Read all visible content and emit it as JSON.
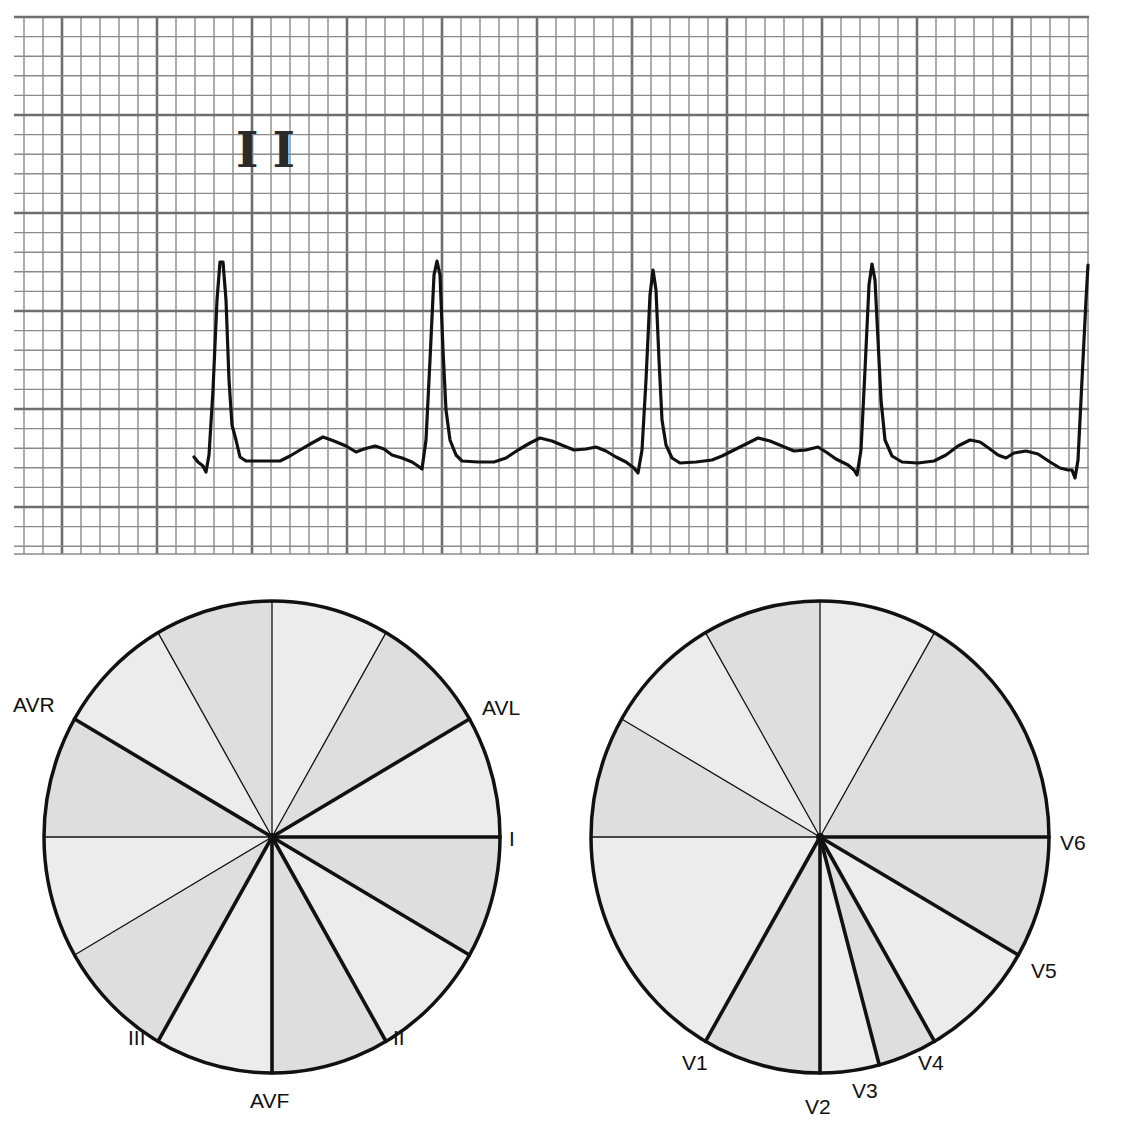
{
  "ecg_strip": {
    "lead_label": "II",
    "grid": {
      "left": 14,
      "top": 16,
      "right": 1089,
      "bottom": 554,
      "major_x_origin": 62,
      "major_x_step": 95,
      "major_y_origin": 17,
      "major_y_step": 98,
      "minor_per_major": 5
    },
    "colors": {
      "grid_minor": "#8a8a8a",
      "grid_major": "#6e6e6e",
      "trace": "#111111",
      "paper": "#ffffff"
    },
    "trace_points": [
      [
        194,
        457
      ],
      [
        198,
        462
      ],
      [
        203,
        466
      ],
      [
        206,
        472
      ],
      [
        209,
        455
      ],
      [
        213,
        390
      ],
      [
        217,
        300
      ],
      [
        220,
        262
      ],
      [
        223,
        262
      ],
      [
        226,
        300
      ],
      [
        229,
        380
      ],
      [
        232,
        425
      ],
      [
        236,
        440
      ],
      [
        240,
        457
      ],
      [
        246,
        461
      ],
      [
        262,
        461
      ],
      [
        280,
        461
      ],
      [
        290,
        456
      ],
      [
        300,
        450
      ],
      [
        312,
        443
      ],
      [
        323,
        437
      ],
      [
        334,
        441
      ],
      [
        346,
        446
      ],
      [
        356,
        452
      ],
      [
        364,
        449
      ],
      [
        375,
        446
      ],
      [
        384,
        449
      ],
      [
        392,
        455
      ],
      [
        402,
        458
      ],
      [
        412,
        462
      ],
      [
        418,
        466
      ],
      [
        422,
        469
      ],
      [
        426,
        440
      ],
      [
        430,
        360
      ],
      [
        434,
        275
      ],
      [
        437,
        261
      ],
      [
        440,
        275
      ],
      [
        443,
        350
      ],
      [
        446,
        410
      ],
      [
        450,
        440
      ],
      [
        456,
        455
      ],
      [
        462,
        461
      ],
      [
        478,
        462
      ],
      [
        494,
        462
      ],
      [
        506,
        458
      ],
      [
        518,
        450
      ],
      [
        530,
        443
      ],
      [
        540,
        438
      ],
      [
        552,
        441
      ],
      [
        564,
        446
      ],
      [
        574,
        450
      ],
      [
        586,
        449
      ],
      [
        596,
        447
      ],
      [
        606,
        451
      ],
      [
        616,
        457
      ],
      [
        626,
        462
      ],
      [
        634,
        468
      ],
      [
        638,
        473
      ],
      [
        642,
        450
      ],
      [
        646,
        380
      ],
      [
        650,
        295
      ],
      [
        653,
        270
      ],
      [
        656,
        290
      ],
      [
        659,
        360
      ],
      [
        662,
        420
      ],
      [
        666,
        445
      ],
      [
        672,
        458
      ],
      [
        680,
        463
      ],
      [
        696,
        462
      ],
      [
        712,
        460
      ],
      [
        722,
        456
      ],
      [
        734,
        450
      ],
      [
        746,
        444
      ],
      [
        758,
        438
      ],
      [
        770,
        441
      ],
      [
        782,
        446
      ],
      [
        794,
        451
      ],
      [
        806,
        450
      ],
      [
        818,
        447
      ],
      [
        826,
        452
      ],
      [
        836,
        459
      ],
      [
        848,
        465
      ],
      [
        854,
        470
      ],
      [
        857,
        475
      ],
      [
        861,
        450
      ],
      [
        865,
        370
      ],
      [
        869,
        285
      ],
      [
        872,
        264
      ],
      [
        875,
        280
      ],
      [
        878,
        340
      ],
      [
        881,
        400
      ],
      [
        885,
        440
      ],
      [
        892,
        456
      ],
      [
        902,
        462
      ],
      [
        918,
        463
      ],
      [
        934,
        461
      ],
      [
        946,
        455
      ],
      [
        958,
        446
      ],
      [
        970,
        440
      ],
      [
        980,
        442
      ],
      [
        990,
        449
      ],
      [
        998,
        455
      ],
      [
        1006,
        458
      ],
      [
        1014,
        453
      ],
      [
        1026,
        451
      ],
      [
        1038,
        454
      ],
      [
        1050,
        462
      ],
      [
        1060,
        468
      ],
      [
        1068,
        470
      ],
      [
        1072,
        470
      ],
      [
        1075,
        478
      ],
      [
        1078,
        460
      ],
      [
        1082,
        380
      ],
      [
        1086,
        300
      ],
      [
        1088,
        265
      ]
    ]
  },
  "limb_leads_diagram": {
    "center": [
      272,
      837
    ],
    "rx": 228,
    "ry": 236,
    "fills": {
      "dark": "#dedede",
      "light": "#ececec"
    },
    "spokes": [
      {
        "angle": 0,
        "weight": "thick"
      },
      {
        "angle": 30,
        "weight": "thick"
      },
      {
        "angle": 60,
        "weight": "thick"
      },
      {
        "angle": 90,
        "weight": "thick"
      },
      {
        "angle": 120,
        "weight": "thick"
      },
      {
        "angle": 150,
        "weight": "thin"
      },
      {
        "angle": 180,
        "weight": "thin"
      },
      {
        "angle": -150,
        "weight": "thick"
      },
      {
        "angle": -120,
        "weight": "thin"
      },
      {
        "angle": -90,
        "weight": "thin"
      },
      {
        "angle": -60,
        "weight": "thin"
      },
      {
        "angle": -30,
        "weight": "thick"
      }
    ],
    "sectors": [
      {
        "from": -90,
        "to": -60,
        "shade": "light"
      },
      {
        "from": -60,
        "to": -30,
        "shade": "dark"
      },
      {
        "from": -30,
        "to": 0,
        "shade": "light"
      },
      {
        "from": 0,
        "to": 30,
        "shade": "dark"
      },
      {
        "from": 30,
        "to": 60,
        "shade": "light"
      },
      {
        "from": 60,
        "to": 90,
        "shade": "dark"
      },
      {
        "from": 90,
        "to": 120,
        "shade": "light"
      },
      {
        "from": 120,
        "to": 150,
        "shade": "dark"
      },
      {
        "from": 150,
        "to": 180,
        "shade": "light"
      },
      {
        "from": 180,
        "to": 210,
        "shade": "dark"
      },
      {
        "from": 210,
        "to": 240,
        "shade": "light"
      },
      {
        "from": 240,
        "to": 270,
        "shade": "dark"
      }
    ],
    "labels": [
      {
        "text": "AVR",
        "x": 13,
        "y": 712
      },
      {
        "text": "AVL",
        "x": 482,
        "y": 715
      },
      {
        "text": "I",
        "x": 509,
        "y": 846
      },
      {
        "text": "II",
        "x": 393,
        "y": 1045
      },
      {
        "text": "III",
        "x": 128,
        "y": 1045
      },
      {
        "text": "AVF",
        "x": 250,
        "y": 1108
      }
    ]
  },
  "chest_leads_diagram": {
    "center": [
      820,
      837
    ],
    "rx": 229,
    "ry": 236,
    "fills": {
      "dark": "#dedede",
      "light": "#ececec"
    },
    "spokes": [
      {
        "angle": 0,
        "weight": "thick"
      },
      {
        "angle": 30,
        "weight": "thick"
      },
      {
        "angle": 60,
        "weight": "thick"
      },
      {
        "angle": 75,
        "weight": "thick"
      },
      {
        "angle": 90,
        "weight": "thick"
      },
      {
        "angle": 120,
        "weight": "thick"
      },
      {
        "angle": 180,
        "weight": "thin"
      },
      {
        "angle": -150,
        "weight": "thin"
      },
      {
        "angle": -120,
        "weight": "thin"
      },
      {
        "angle": -90,
        "weight": "thin"
      },
      {
        "angle": -60,
        "weight": "thin"
      }
    ],
    "sectors": [
      {
        "from": -90,
        "to": -60,
        "shade": "light"
      },
      {
        "from": -60,
        "to": 0,
        "shade": "dark"
      },
      {
        "from": 0,
        "to": 30,
        "shade": "dark"
      },
      {
        "from": 30,
        "to": 60,
        "shade": "light"
      },
      {
        "from": 60,
        "to": 75,
        "shade": "dark"
      },
      {
        "from": 75,
        "to": 90,
        "shade": "light"
      },
      {
        "from": 90,
        "to": 120,
        "shade": "dark"
      },
      {
        "from": 120,
        "to": 180,
        "shade": "light"
      },
      {
        "from": 180,
        "to": 210,
        "shade": "dark"
      },
      {
        "from": 210,
        "to": 240,
        "shade": "light"
      },
      {
        "from": 240,
        "to": 270,
        "shade": "dark"
      }
    ],
    "labels": [
      {
        "text": "V1",
        "x": 682,
        "y": 1070
      },
      {
        "text": "V2",
        "x": 805,
        "y": 1114
      },
      {
        "text": "V3",
        "x": 852,
        "y": 1098
      },
      {
        "text": "V4",
        "x": 918,
        "y": 1070
      },
      {
        "text": "V5",
        "x": 1031,
        "y": 978
      },
      {
        "text": "V6",
        "x": 1060,
        "y": 850
      }
    ]
  },
  "chart_data": {
    "type": "diagram",
    "title": "",
    "ecg": {
      "lead": "II",
      "r_peaks_x": [
        221,
        436,
        653,
        872,
        1088
      ]
    },
    "limb_leads": [
      {
        "lead": "I",
        "angle_deg": 0
      },
      {
        "lead": "II",
        "angle_deg": 60
      },
      {
        "lead": "III",
        "angle_deg": 120
      },
      {
        "lead": "AVF",
        "angle_deg": 90
      },
      {
        "lead": "AVL",
        "angle_deg": -30
      },
      {
        "lead": "AVR",
        "angle_deg": -150
      }
    ],
    "chest_leads": [
      {
        "lead": "V1",
        "angle_deg": 120
      },
      {
        "lead": "V2",
        "angle_deg": 90
      },
      {
        "lead": "V3",
        "angle_deg": 75
      },
      {
        "lead": "V4",
        "angle_deg": 60
      },
      {
        "lead": "V5",
        "angle_deg": 30
      },
      {
        "lead": "V6",
        "angle_deg": 0
      }
    ]
  }
}
